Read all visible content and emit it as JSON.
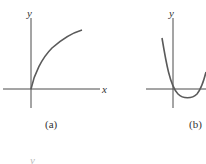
{
  "figure": {
    "panels": [
      {
        "id": "a",
        "caption": "(a)",
        "x_label": "x",
        "y_label": "y",
        "curve": "concave-down increasing curve from origin (square-root-like)"
      },
      {
        "id": "b",
        "caption": "(b)",
        "y_label": "y",
        "curve": "upward-opening parabola with vertex just right of y-axis, below x-axis"
      }
    ],
    "bottom_fragment": "y"
  },
  "colors": {
    "axis": "#4a4a4a",
    "curve": "#5a5a5a",
    "background": "#ffffff"
  }
}
